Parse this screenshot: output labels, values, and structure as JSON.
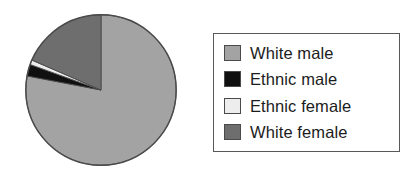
{
  "figure": {
    "title": "",
    "background_color": "#ffffff"
  },
  "chart_data": {
    "type": "pie",
    "title": "",
    "xlabel": "",
    "ylabel": "",
    "grid": false,
    "legend_position": "right",
    "start_angle_deg": 90,
    "direction": "clockwise",
    "categories": [
      "White male",
      "Ethnic male",
      "Ethnic female",
      "White female"
    ],
    "values": [
      78,
      2.5,
      1,
      18.5
    ],
    "value_unit": "percent",
    "colors": [
      "#a3a3a3",
      "#101010",
      "#ededed",
      "#6e6e6e"
    ],
    "slices": [
      {
        "label": "White male",
        "value": 78,
        "color": "#a3a3a3"
      },
      {
        "label": "Ethnic male",
        "value": 2.5,
        "color": "#101010"
      },
      {
        "label": "Ethnic female",
        "value": 1,
        "color": "#ededed"
      },
      {
        "label": "White female",
        "value": 18.5,
        "color": "#6e6e6e"
      }
    ],
    "outline_color": "#4a4a4c"
  },
  "legend": {
    "border_color": "#58585a",
    "background_color": "#ffffff",
    "items": [
      {
        "label": "White male",
        "color": "#a3a3a3"
      },
      {
        "label": "Ethnic male",
        "color": "#101010"
      },
      {
        "label": "Ethnic female",
        "color": "#ededed"
      },
      {
        "label": "White female",
        "color": "#6e6e6e"
      }
    ]
  }
}
